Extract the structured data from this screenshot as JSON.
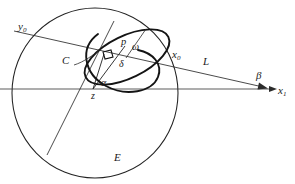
{
  "figure": {
    "ink_color": "#1a1a1a",
    "thin_color": "#3a3a3a",
    "background": "#ffffff",
    "width": 295,
    "height": 184
  },
  "labels": {
    "y0": {
      "text": "y",
      "sub": "0",
      "x": 18,
      "y": 27
    },
    "C": {
      "text": "C",
      "sub": "",
      "x": 62,
      "y": 61
    },
    "p": {
      "text": "p",
      "sub": "",
      "x": 122,
      "y": 42
    },
    "omega": {
      "text": "ω",
      "sub": "",
      "x": 133,
      "y": 47
    },
    "delta": {
      "text": "δ",
      "sub": "",
      "x": 120,
      "y": 64
    },
    "alpha": {
      "text": "α",
      "sub": "",
      "x": 102,
      "y": 83
    },
    "z": {
      "text": "z",
      "sub": "",
      "x": 92,
      "y": 95
    },
    "x0": {
      "text": "x",
      "sub": "0",
      "x": 174,
      "y": 55
    },
    "L": {
      "text": "L",
      "sub": "",
      "x": 204,
      "y": 62
    },
    "beta": {
      "text": "β",
      "sub": "",
      "x": 257,
      "y": 76
    },
    "x1": {
      "text": "x",
      "sub": "1",
      "x": 279,
      "y": 91
    },
    "E": {
      "text": "E",
      "sub": "",
      "x": 115,
      "y": 158
    }
  },
  "geometry": {
    "outer_ellipse": {
      "name": "E",
      "cx": 95,
      "cy": 93,
      "rx": 83,
      "ry": 85
    },
    "axis_x1": {
      "name": "x1-axis",
      "x_start": 0,
      "x_end": 272,
      "y": 89
    },
    "ray_L": {
      "name": "L",
      "from_x": 14,
      "from_y": 31,
      "to_x": 268,
      "to_y": 88
    },
    "chord_through_z": {
      "name": "chord",
      "from_x": 113,
      "from_y": 22,
      "to_x": 48,
      "to_y": 153
    },
    "segment_z_p": {
      "name": "z-to-p",
      "from_x": 93,
      "from_y": 89,
      "to_x": 124,
      "to_y": 48
    },
    "segment_z_perp": {
      "name": "z-to-foot",
      "from_x": 93,
      "from_y": 89,
      "to_x": 105,
      "to_y": 53
    },
    "tilted_circle": {
      "name": "C",
      "cx": 127,
      "cy": 56,
      "rx": 46,
      "ry": 21,
      "rotation": -27
    },
    "tilted_circle_back": {
      "name": "C-back",
      "cx": 124,
      "cy": 57,
      "rx": 44,
      "ry": 20,
      "rotation": -58
    },
    "right_angle_marker": {
      "name": "right-angle",
      "x": 104,
      "y": 51,
      "size": 8
    },
    "leader_C": {
      "name": "C-pointer",
      "from_x": 73,
      "from_y": 64,
      "to_x": 100,
      "to_y": 50
    }
  }
}
